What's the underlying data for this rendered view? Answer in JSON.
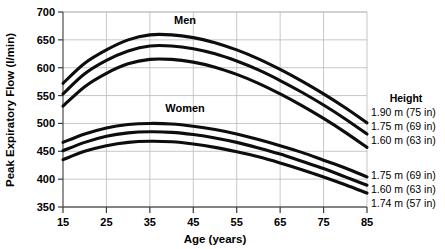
{
  "chart_data": {
    "type": "line",
    "title": "",
    "xlabel": "Age (years)",
    "ylabel": "Peak Expiratory Flow (l/min)",
    "xlim": [
      15,
      85
    ],
    "ylim": [
      350,
      700
    ],
    "xticks": [
      15,
      25,
      35,
      45,
      55,
      65,
      75,
      85
    ],
    "yticks": [
      350,
      400,
      450,
      500,
      550,
      600,
      650,
      700
    ],
    "grid": true,
    "legend_position": "right",
    "annotations": [
      {
        "text": "Men",
        "x": 35,
        "y": 682
      },
      {
        "text": "Women",
        "x": 35,
        "y": 524
      }
    ],
    "x": [
      15,
      20,
      25,
      30,
      35,
      40,
      45,
      50,
      55,
      60,
      65,
      70,
      75,
      80,
      85
    ],
    "series": [
      {
        "name": "Men 1.90 m (75 in)",
        "group": "Men",
        "height": "1.90 m (75 in)",
        "values": [
          572,
          608,
          632,
          650,
          659,
          659,
          654,
          645,
          632,
          616,
          597,
          576,
          553,
          528,
          501
        ]
      },
      {
        "name": "Men 1.75 m (69 in)",
        "group": "Men",
        "height": "1.75 m (69 in)",
        "values": [
          553,
          589,
          613,
          630,
          639,
          639,
          634,
          625,
          612,
          596,
          577,
          556,
          533,
          508,
          481
        ]
      },
      {
        "name": "Men 1.60 m (63 in)",
        "group": "Men",
        "height": "1.60 m (63 in)",
        "values": [
          531,
          566,
          590,
          607,
          615,
          615,
          610,
          601,
          588,
          572,
          553,
          532,
          509,
          484,
          457
        ]
      },
      {
        "name": "Women 1.75 m (69 in)",
        "group": "Women",
        "height": "1.75 m (69 in)",
        "values": [
          466,
          481,
          492,
          498,
          500,
          499,
          495,
          489,
          481,
          471,
          460,
          448,
          434,
          420,
          404
        ]
      },
      {
        "name": "Women 1.60 m (63 in)",
        "group": "Women",
        "height": "1.60 m (63 in)",
        "values": [
          451,
          466,
          477,
          483,
          485,
          484,
          480,
          474,
          466,
          456,
          445,
          432,
          419,
          404,
          389
        ]
      },
      {
        "name": "Women 1.74 m (57 in)",
        "group": "Women",
        "height": "1.74 m (57 in)",
        "values": [
          435,
          450,
          460,
          466,
          468,
          467,
          463,
          457,
          449,
          440,
          429,
          417,
          404,
          390,
          375
        ]
      }
    ]
  },
  "legend": {
    "title": "Height",
    "men_entries": [
      "1.90 m (75 in)",
      "1.75 m (69 in)",
      "1.60 m (63 in)"
    ],
    "women_entries": [
      "1.75 m (69 in)",
      "1.60 m (63 in)",
      "1.74 m (57 in)"
    ]
  },
  "axes": {
    "x_title": "Age (years)",
    "y_title": "Peak Expiratory Flow (l/min)",
    "x_tick_labels": [
      "15",
      "25",
      "35",
      "45",
      "55",
      "65",
      "75",
      "85"
    ],
    "y_tick_labels": [
      "350",
      "400",
      "450",
      "500",
      "550",
      "600",
      "650",
      "700"
    ]
  },
  "series_labels": {
    "men": "Men",
    "women": "Women"
  },
  "colors": {
    "curve": "#0d0d0d",
    "grid": "#b9b9b9",
    "axis": "#5a5a5a",
    "background": "#ffffff"
  }
}
